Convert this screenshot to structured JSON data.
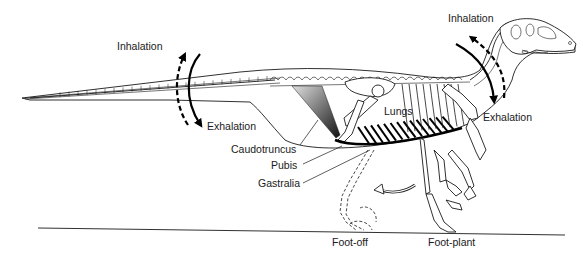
{
  "figure": {
    "labels": {
      "inhalation_tail": "Inhalation",
      "exhalation_tail": "Exhalation",
      "inhalation_neck": "Inhalation",
      "exhalation_neck": "Exhalation",
      "lungs": "Lungs",
      "caudotruncus": "Caudotruncus",
      "pubis": "Pubis",
      "gastralia": "Gastralia",
      "foot_off": "Foot-off",
      "foot_plant": "Foot-plant"
    },
    "colors": {
      "ink": "#1a1a1a",
      "background": "#ffffff"
    }
  }
}
